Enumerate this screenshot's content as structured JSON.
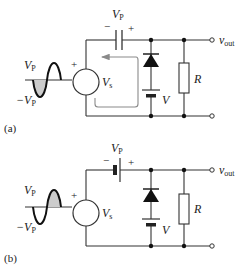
{
  "figure": {
    "panels": [
      {
        "id": "a",
        "caption": "(a)",
        "series_element": "capacitor",
        "series_label": "V",
        "series_label_sub": "P",
        "series_minus": "−",
        "series_plus": "+",
        "source_label": "V",
        "source_label_sub": "s",
        "source_plus": "+",
        "wave_top_label": "V",
        "wave_top_sub": "P",
        "wave_bottom_label": "−V",
        "wave_bottom_sub": "P",
        "wave_shaded_half": "negative",
        "battery_label": "V",
        "resistor_label": "R",
        "output_label": "v",
        "output_sub": "out",
        "current_loop_shown": true
      },
      {
        "id": "b",
        "caption": "(b)",
        "series_element": "battery",
        "series_label": "V",
        "series_label_sub": "P",
        "series_minus": "−",
        "series_plus": "+",
        "source_label": "V",
        "source_label_sub": "s",
        "source_plus": "+",
        "wave_top_label": "V",
        "wave_top_sub": "P",
        "wave_bottom_label": "−V",
        "wave_bottom_sub": "P",
        "wave_shaded_half": "positive",
        "battery_label": "V",
        "resistor_label": "R",
        "output_label": "v",
        "output_sub": "out",
        "current_loop_shown": false
      }
    ],
    "colors": {
      "wire": "#333333",
      "shade": "#cccccc",
      "loop_arrow": "#8a8a8a"
    }
  }
}
